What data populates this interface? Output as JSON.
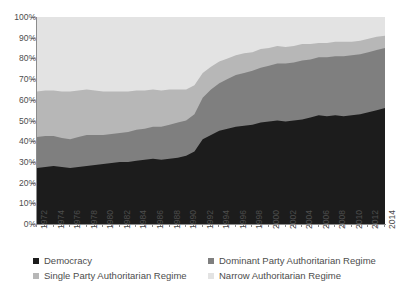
{
  "chart_data": {
    "type": "area",
    "stacked": true,
    "title": "",
    "subtitle": "",
    "xlabel": "",
    "ylabel": "",
    "ylim": [
      0,
      100
    ],
    "ytick_labels": [
      "0%",
      "10%",
      "20%",
      "30%",
      "40%",
      "50%",
      "60%",
      "70%",
      "80%",
      "90%",
      "100%"
    ],
    "ytick_values": [
      0,
      10,
      20,
      30,
      40,
      50,
      60,
      70,
      80,
      90,
      100
    ],
    "grid": false,
    "legend_position": "bottom",
    "x": [
      1972,
      1973,
      1974,
      1975,
      1976,
      1977,
      1978,
      1979,
      1980,
      1981,
      1982,
      1983,
      1984,
      1985,
      1986,
      1987,
      1988,
      1989,
      1990,
      1991,
      1992,
      1993,
      1994,
      1995,
      1996,
      1997,
      1998,
      1999,
      2000,
      2001,
      2002,
      2003,
      2004,
      2005,
      2006,
      2007,
      2008,
      2009,
      2010,
      2011,
      2012,
      2013,
      2014
    ],
    "xtick_labels": [
      "1972",
      "1974",
      "1976",
      "1978",
      "1980",
      "1982",
      "1984",
      "1986",
      "1988",
      "1990",
      "1992",
      "1994",
      "1996",
      "1998",
      "2000",
      "2002",
      "2004",
      "2006",
      "2008",
      "2010",
      "2012",
      "2014"
    ],
    "series": [
      {
        "name": "Democracy",
        "color": "#1c1c1c",
        "values": [
          27,
          27.5,
          28,
          27.5,
          27,
          27.5,
          28,
          28.5,
          29,
          29.5,
          30,
          30,
          30.5,
          31,
          31.5,
          31,
          31.5,
          32,
          33,
          35,
          41,
          43,
          45,
          46,
          47,
          47.5,
          48,
          49,
          49.5,
          50,
          49.5,
          50,
          50.5,
          51.5,
          52.5,
          52,
          52.5,
          52,
          52.5,
          53,
          54,
          55,
          56
        ]
      },
      {
        "name": "Dominant Party Authoritarian Regime",
        "color": "#7f7f7f",
        "values": [
          15,
          15,
          14.5,
          14,
          14,
          14.5,
          15,
          14.5,
          14,
          14,
          14,
          14.5,
          15,
          15,
          15.5,
          16,
          16.5,
          17,
          17,
          18,
          20,
          22,
          23,
          24,
          25,
          25.5,
          26,
          26.5,
          27,
          27.5,
          28,
          28,
          28.5,
          28,
          28,
          28.5,
          28.5,
          29,
          29,
          29,
          29,
          29,
          29
        ]
      },
      {
        "name": "Single Party Authoritarian Regime",
        "color": "#b7b7b7",
        "values": [
          22,
          22,
          22,
          22.5,
          23,
          22.5,
          22,
          21.5,
          21,
          20.5,
          20,
          19.5,
          19,
          18.5,
          18,
          17.5,
          17,
          16,
          15,
          14,
          12,
          11,
          10.5,
          10,
          9.5,
          9.5,
          9,
          9,
          8.5,
          8.5,
          8,
          8,
          8,
          7.5,
          7,
          7,
          7,
          7,
          6.5,
          6.5,
          6.5,
          6.5,
          6
        ]
      },
      {
        "name": "Narrow Authoritarian Regime",
        "color": "#e3e3e3",
        "values": [
          36,
          35.5,
          35.5,
          36,
          36,
          35.5,
          35,
          35.5,
          36,
          36,
          36,
          36,
          35.5,
          35.5,
          35,
          35.5,
          35,
          35,
          35,
          33,
          27,
          24,
          21.5,
          20,
          18.5,
          17.5,
          17,
          15.5,
          15,
          14,
          14.5,
          14,
          13,
          13,
          12.5,
          12.5,
          12,
          12,
          12,
          11.5,
          10.5,
          9.5,
          9
        ]
      }
    ]
  },
  "legend": {
    "items": [
      {
        "label": "Democracy",
        "color": "#1c1c1c"
      },
      {
        "label": "Dominant Party Authoritarian Regime",
        "color": "#7f7f7f"
      },
      {
        "label": "Single Party Authoritarian Regime",
        "color": "#b7b7b7"
      },
      {
        "label": "Narrow Authoritarian Regime",
        "color": "#e3e3e3"
      }
    ]
  }
}
